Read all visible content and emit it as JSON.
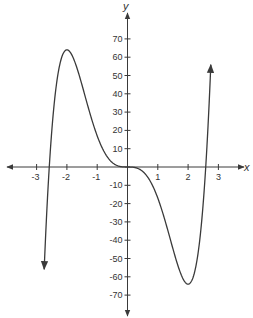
{
  "chart_data": {
    "type": "line",
    "title": "",
    "xlabel": "x",
    "ylabel": "y",
    "function": "y = 3x^5 - 20x^3",
    "xlim": [
      -3.9,
      3.9
    ],
    "ylim": [
      -82,
      84
    ],
    "grid": false,
    "legend": null,
    "x_ticks": [
      -3,
      -2,
      -1,
      1,
      2,
      3
    ],
    "x_tick_labels": [
      "-3",
      "-2",
      "-1",
      "1",
      "2",
      "3"
    ],
    "y_ticks": [
      70,
      60,
      50,
      40,
      30,
      20,
      10,
      -10,
      -20,
      -30,
      -40,
      -50,
      -60,
      -70
    ],
    "y_tick_labels": [
      "70",
      "60",
      "50",
      "40",
      "30",
      "20",
      "10",
      "-10",
      "-20",
      "-30",
      "-40",
      "-50",
      "-60",
      "-70"
    ],
    "series": [
      {
        "name": "f(x)",
        "x": [
          -2.75,
          -2.6,
          -2.4,
          -2.2,
          -2.0,
          -1.8,
          -1.6,
          -1.4,
          -1.2,
          -1.0,
          -0.8,
          -0.6,
          -0.4,
          -0.2,
          0,
          0.2,
          0.4,
          0.6,
          0.8,
          1.0,
          1.2,
          1.4,
          1.6,
          1.8,
          2.0,
          2.2,
          2.4,
          2.6,
          2.75
        ],
        "y": [
          -55.9,
          -3.9,
          37.9,
          59.8,
          64.0,
          54.0,
          50.6,
          38.4,
          27.1,
          17.0,
          9.3,
          4.1,
          1.2,
          0.2,
          0,
          -0.2,
          -1.2,
          -4.1,
          -9.3,
          -17.0,
          -27.1,
          -38.4,
          -50.6,
          -54.0,
          -64.0,
          -59.8,
          -37.9,
          3.9,
          55.9
        ]
      }
    ],
    "annotations": {
      "left_end_arrow": {
        "x": -2.75,
        "y": -56,
        "direction": "down"
      },
      "right_end_arrow": {
        "x": 2.75,
        "y": 56,
        "direction": "up"
      },
      "local_max": {
        "x": -2,
        "y": 64
      },
      "local_min": {
        "x": 2,
        "y": -64
      }
    }
  },
  "axes": {
    "x_label": "x",
    "y_label": "y"
  },
  "colors": {
    "curve": "#3a3a3a",
    "axis": "#3a3a3a",
    "background": "#ffffff"
  }
}
